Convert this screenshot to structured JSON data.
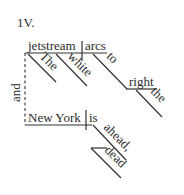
{
  "diagram": {
    "label": "1V.",
    "conjunction": "and",
    "clause1": {
      "subject": "jetstream",
      "verb": "arcs",
      "subject_modifiers": [
        "The",
        "white"
      ],
      "preposition": "to",
      "prep_object": "right",
      "prep_object_modifier": "the"
    },
    "clause2": {
      "subject": "New York",
      "verb": "is",
      "verb_modifier": "ahead,",
      "verb_modifier_2": "dead"
    }
  }
}
